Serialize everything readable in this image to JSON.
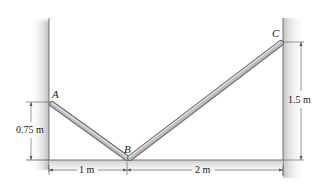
{
  "diagram": {
    "points": {
      "A": {
        "label": "A"
      },
      "B": {
        "label": "B"
      },
      "C": {
        "label": "C"
      }
    },
    "dimensions": {
      "left_height": "0.75 m",
      "right_height": "1.5 m",
      "left_span": "1 m",
      "right_span": "2 m"
    },
    "colors": {
      "wall_shade": "#c9c9c9",
      "rod": "#b8b8b8",
      "rod_edge": "#6f6f6f",
      "line": "#555555"
    }
  }
}
